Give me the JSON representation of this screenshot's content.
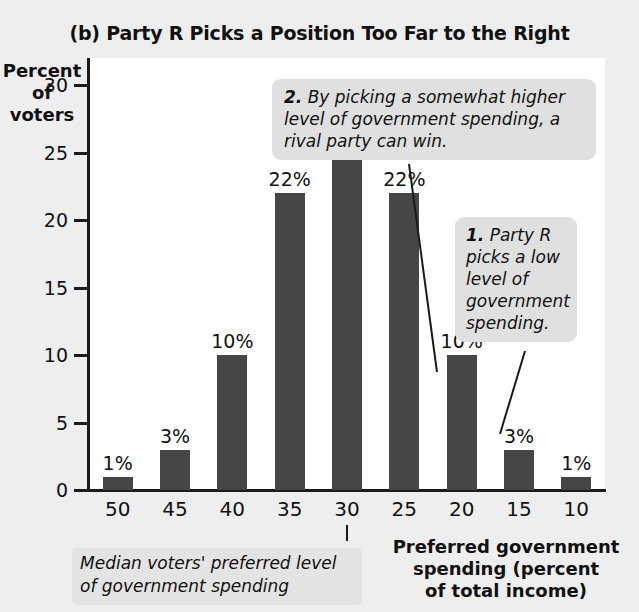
{
  "chart_data": {
    "type": "bar",
    "title": "(b) Party R Picks a Position Too Far to the Right",
    "xlabel": "Preferred government spending (percent of total income)",
    "ylabel": "Percent of voters",
    "categories": [
      "50",
      "45",
      "40",
      "35",
      "30",
      "25",
      "20",
      "15",
      "10"
    ],
    "values": [
      1,
      3,
      10,
      22,
      28,
      22,
      10,
      3,
      1
    ],
    "value_labels": [
      "1%",
      "3%",
      "10%",
      "22%",
      "28%",
      "22%",
      "10%",
      "3%",
      "1%"
    ],
    "ylim": [
      0,
      32
    ],
    "yticks": [
      0,
      5,
      10,
      15,
      20,
      25,
      30
    ],
    "ytick_labels": [
      "0",
      "5",
      "10",
      "15",
      "20",
      "25",
      "30"
    ],
    "grid": false,
    "legend": "none",
    "bar_color": "#464646",
    "plot_background": "#ffffff",
    "page_background": "#eeeeee",
    "annotations": [
      {
        "id": "1",
        "number": "1.",
        "text": "Party R picks a low level of government spending.",
        "points_to_category": "15"
      },
      {
        "id": "2",
        "number": "2.",
        "text": "By picking a somewhat higher level of government spending, a rival party can win.",
        "points_to_category": "20"
      }
    ],
    "median_marker": {
      "category": "30",
      "caption": "Median voters' preferred level of government spending"
    }
  },
  "axis": {
    "y_title_lines": [
      "Percent",
      "of",
      "voters"
    ],
    "x_title_lines": [
      "Preferred government",
      "spending (percent",
      "of total income)"
    ]
  },
  "callouts": {
    "one": {
      "number": "1.",
      "body": "Party R picks a low level of government spending."
    },
    "two": {
      "number": "2.",
      "body": "By picking a somewhat higher level of government spending, a rival party can win."
    }
  },
  "median_caption": "Median voters' preferred level of government spending"
}
